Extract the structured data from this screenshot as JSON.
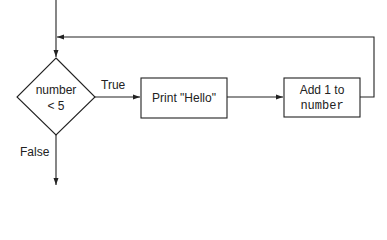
{
  "diagram": {
    "type": "flowchart",
    "colors": {
      "stroke": "#222222",
      "background": "#ffffff",
      "text": "#222222"
    },
    "nodes": [
      {
        "id": "decision",
        "shape": "diamond",
        "line1": "number",
        "line2": "< 5"
      },
      {
        "id": "print",
        "shape": "rectangle",
        "label": "Print \"Hello\""
      },
      {
        "id": "increment",
        "shape": "rectangle",
        "line1": "Add 1 to",
        "line2": "number"
      }
    ],
    "edges": [
      {
        "from": "start",
        "to": "decision",
        "label": ""
      },
      {
        "from": "decision",
        "to": "print",
        "label": "True"
      },
      {
        "from": "print",
        "to": "increment",
        "label": ""
      },
      {
        "from": "increment",
        "to": "decision",
        "label": ""
      },
      {
        "from": "decision",
        "to": "end",
        "label": "False"
      }
    ],
    "labels": {
      "true": "True",
      "false": "False"
    }
  }
}
